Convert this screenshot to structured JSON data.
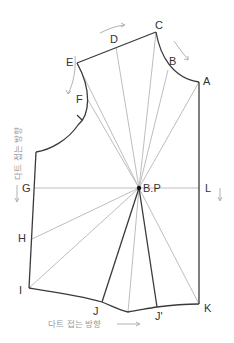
{
  "diagram": {
    "type": "bodice pattern dart manipulation (pivot from bust point)",
    "colors": {
      "outline": "#3a3a3a",
      "guide_lines": "#b5b5b5",
      "arrows_text": "#9a9a9a",
      "bust_point": "#111111"
    },
    "points": {
      "A": {
        "label": "A",
        "x": 199,
        "y": 82
      },
      "B": {
        "label": "B",
        "x": 168,
        "y": 70
      },
      "C": {
        "label": "C",
        "x": 156,
        "y": 32
      },
      "D": {
        "label": "D",
        "x": 116,
        "y": 47
      },
      "E": {
        "label": "E",
        "x": 77,
        "y": 63
      },
      "F": {
        "label": "F",
        "x": 88,
        "y": 100
      },
      "G": {
        "label": "G",
        "x": 35,
        "y": 188
      },
      "H": {
        "label": "H",
        "x": 32,
        "y": 239
      },
      "I": {
        "label": "I",
        "x": 29,
        "y": 288
      },
      "J": {
        "label": "J",
        "x": 102,
        "y": 302
      },
      "J2": {
        "label": "J'",
        "x": 157,
        "y": 307
      },
      "K": {
        "label": "K",
        "x": 199,
        "y": 304
      },
      "L": {
        "label": "L",
        "x": 199,
        "y": 188
      },
      "BP": {
        "label": "B.P",
        "x": 139,
        "y": 188
      }
    },
    "annotations": {
      "left_direction_text": "다트 접는 방향",
      "bottom_direction_text": "다트 접는 방향"
    }
  }
}
